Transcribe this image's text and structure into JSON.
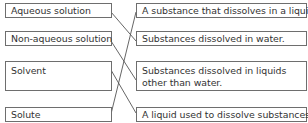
{
  "matching_exercise": {
    "terms": [
      {
        "label": "Aqueous solution"
      },
      {
        "label": "Non-aqueous solution"
      },
      {
        "label": "Solvent"
      },
      {
        "label": "Solute"
      }
    ],
    "definitions": [
      {
        "label": "A substance that dissolves in a liquid."
      },
      {
        "label": "Substances dissolved in water."
      },
      {
        "label": "Substances dissolved in liquids other than water."
      },
      {
        "label": "A liquid used to dissolve substances."
      }
    ],
    "connections": [
      {
        "term": "Aqueous solution",
        "definition": "Substances dissolved in water."
      },
      {
        "term": "Non-aqueous solution",
        "definition": "Substances dissolved in liquids other than water."
      },
      {
        "term": "Solvent",
        "definition": "A liquid used to dissolve substances."
      },
      {
        "term": "Solute",
        "definition": "A substance that dissolves in a liquid."
      }
    ],
    "colors": {
      "border": "#6e6e6e",
      "text": "#333333",
      "line": "#555555"
    }
  }
}
